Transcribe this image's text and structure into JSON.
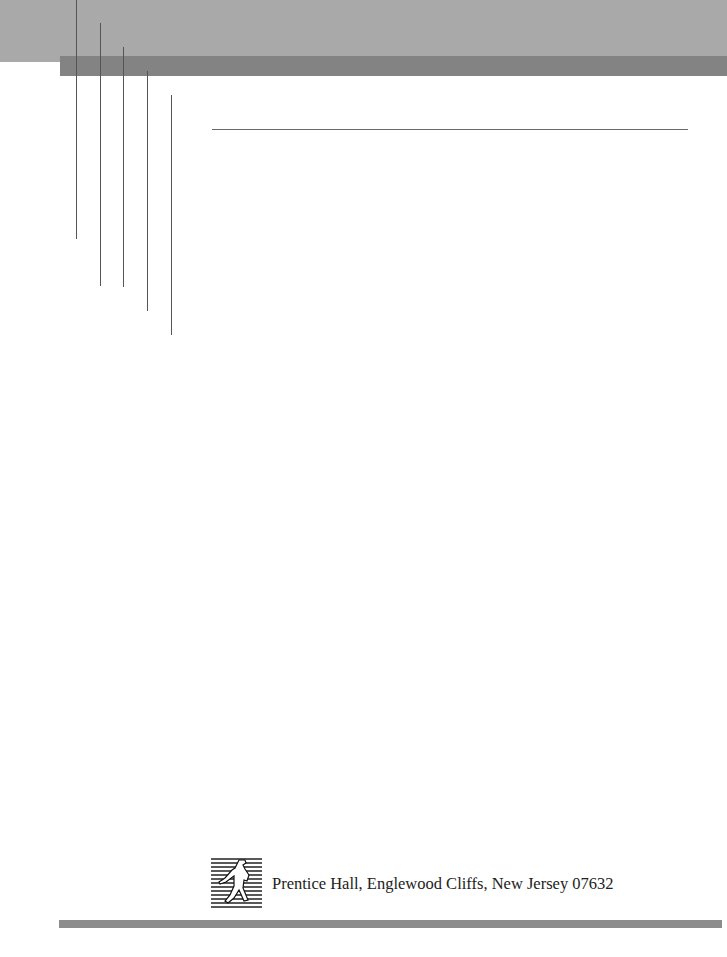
{
  "page": {
    "type": "title-page-verso",
    "colors": {
      "top_band": "#a9a9a9",
      "dark_band": "#838383",
      "rule": "#6a6a6a",
      "bottom_band": "#8c8c8c"
    }
  },
  "decoration": {
    "vertical_lines": [
      {
        "x": 76,
        "bottom": 239
      },
      {
        "x": 100,
        "bottom": 263
      },
      {
        "x": 123,
        "bottom": 287
      },
      {
        "x": 147,
        "bottom": 311
      },
      {
        "x": 171,
        "bottom": 335
      }
    ]
  },
  "footer": {
    "logo_icon": "prentice-hall-sower-logo",
    "publisher_line": "Prentice Hall, Englewood Cliffs, New Jersey 07632"
  }
}
